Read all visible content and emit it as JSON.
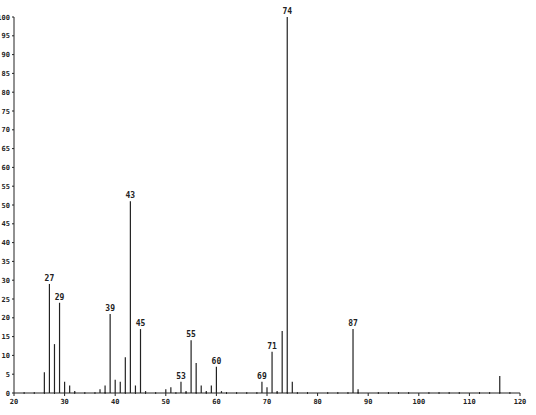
{
  "chart_data": {
    "type": "bar",
    "title": "",
    "xlabel": "",
    "ylabel": "",
    "xlim": [
      20,
      120
    ],
    "ylim": [
      0,
      100
    ],
    "x_ticks": [
      20,
      30,
      40,
      50,
      60,
      70,
      80,
      90,
      100,
      110,
      120
    ],
    "y_ticks": [
      0,
      5,
      10,
      15,
      20,
      25,
      30,
      35,
      40,
      45,
      50,
      55,
      60,
      65,
      70,
      75,
      80,
      85,
      90,
      95,
      100
    ],
    "grid": false,
    "peaks": [
      {
        "mz": 26,
        "intensity": 5.5
      },
      {
        "mz": 27,
        "intensity": 29,
        "label": "27"
      },
      {
        "mz": 28,
        "intensity": 13
      },
      {
        "mz": 29,
        "intensity": 24,
        "label": "29"
      },
      {
        "mz": 30,
        "intensity": 3
      },
      {
        "mz": 31,
        "intensity": 2
      },
      {
        "mz": 32,
        "intensity": 0.5
      },
      {
        "mz": 37,
        "intensity": 1
      },
      {
        "mz": 38,
        "intensity": 2
      },
      {
        "mz": 39,
        "intensity": 21,
        "label": "39"
      },
      {
        "mz": 40,
        "intensity": 3.5
      },
      {
        "mz": 41,
        "intensity": 3
      },
      {
        "mz": 42,
        "intensity": 9.5
      },
      {
        "mz": 43,
        "intensity": 51,
        "label": "43"
      },
      {
        "mz": 44,
        "intensity": 2
      },
      {
        "mz": 45,
        "intensity": 17,
        "label": "45"
      },
      {
        "mz": 46,
        "intensity": 0.5
      },
      {
        "mz": 50,
        "intensity": 1
      },
      {
        "mz": 51,
        "intensity": 1.5
      },
      {
        "mz": 53,
        "intensity": 3,
        "label": "53"
      },
      {
        "mz": 54,
        "intensity": 0.5
      },
      {
        "mz": 55,
        "intensity": 14,
        "label": "55"
      },
      {
        "mz": 56,
        "intensity": 8
      },
      {
        "mz": 57,
        "intensity": 2
      },
      {
        "mz": 58,
        "intensity": 0.5
      },
      {
        "mz": 59,
        "intensity": 2
      },
      {
        "mz": 60,
        "intensity": 7,
        "label": "60"
      },
      {
        "mz": 61,
        "intensity": 0.5
      },
      {
        "mz": 69,
        "intensity": 3,
        "label": "69"
      },
      {
        "mz": 70,
        "intensity": 1.5
      },
      {
        "mz": 71,
        "intensity": 11,
        "label": "71"
      },
      {
        "mz": 72,
        "intensity": 0.5
      },
      {
        "mz": 73,
        "intensity": 16.5
      },
      {
        "mz": 74,
        "intensity": 100,
        "label": "74"
      },
      {
        "mz": 75,
        "intensity": 3
      },
      {
        "mz": 87,
        "intensity": 17,
        "label": "87"
      },
      {
        "mz": 88,
        "intensity": 1
      },
      {
        "mz": 116,
        "intensity": 4.5
      }
    ]
  }
}
